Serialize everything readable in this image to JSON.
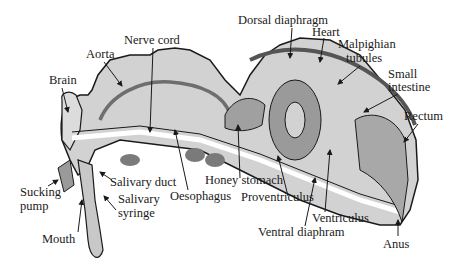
{
  "colors": {
    "body_fill": "#d2d2d2",
    "dark_organ": "#8a8a8a",
    "mid_organ": "#a8a8a8",
    "white_channel": "#ffffff",
    "outline": "#1a1a1a",
    "label_text": "#1a1a1a"
  },
  "labels": {
    "nerve_cord": "Nerve cord",
    "aorta": "Aorta",
    "brain": "Brain",
    "dorsal_diaphragm": "Dorsal diaphragm",
    "heart": "Heart",
    "malpighian_1": "Malpighian",
    "malpighian_2": "tubules",
    "small_intestine_1": "Small",
    "small_intestine_2": "intestine",
    "rectum": "Rectum",
    "sucking_pump_1": "Sucking",
    "sucking_pump_2": "pump",
    "salivary_duct": "Salivary duct",
    "salivary_syringe_1": "Salivary",
    "salivary_syringe_2": "syringe",
    "mouth": "Mouth",
    "oesophagus": "Oesophagus",
    "honey_stomach": "Honey stomach",
    "proventriculus": "Proventriculus",
    "ventriculus": "Ventriculus",
    "ventral_diaphram": "Ventral diaphram",
    "anus": "Anus"
  }
}
